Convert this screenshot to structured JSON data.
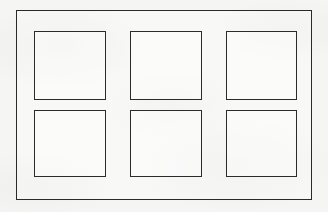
{
  "figure": {
    "kind": "line-diagram",
    "title": "",
    "caption": "",
    "background_color": "#f5f5f3",
    "line_color": "#2b2b2b",
    "fill_color": "#ffffff",
    "canvas": {
      "width": 328,
      "height": 212
    }
  },
  "outer_frame": {
    "name": "outer rectangle",
    "label": "",
    "x": 16,
    "y": 10,
    "width": 296,
    "height": 190,
    "stroke_width": 1.5,
    "stroke_color": "#2a2a2a",
    "fill": "none"
  },
  "grid": {
    "rows": 2,
    "columns": 3,
    "count": 6,
    "cell_width": 72,
    "cell_height": 68,
    "column_gap": 24,
    "row_gap": 10,
    "origin_x": 34,
    "origin_y": 31,
    "cells": [
      {
        "id": "cell-r1c1",
        "row": 1,
        "column": 1,
        "label": "",
        "x": 34,
        "y": 31,
        "width": 72,
        "height": 69
      },
      {
        "id": "cell-r1c2",
        "row": 1,
        "column": 2,
        "label": "",
        "x": 130,
        "y": 31,
        "width": 72,
        "height": 69
      },
      {
        "id": "cell-r1c3",
        "row": 1,
        "column": 3,
        "label": "",
        "x": 226,
        "y": 31,
        "width": 71,
        "height": 69
      },
      {
        "id": "cell-r2c1",
        "row": 2,
        "column": 1,
        "label": "",
        "x": 34,
        "y": 110,
        "width": 72,
        "height": 67
      },
      {
        "id": "cell-r2c2",
        "row": 2,
        "column": 2,
        "label": "",
        "x": 130,
        "y": 110,
        "width": 72,
        "height": 67
      },
      {
        "id": "cell-r2c3",
        "row": 2,
        "column": 3,
        "label": "",
        "x": 226,
        "y": 110,
        "width": 71,
        "height": 67
      }
    ]
  }
}
